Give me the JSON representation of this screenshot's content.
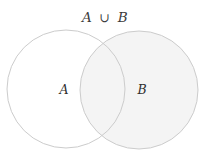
{
  "figure": {
    "kind": "venn-diagram",
    "background_color": "#ffffff",
    "width": 211,
    "height": 155
  },
  "title": {
    "full_text": "A ∪ B",
    "left_operand": "A",
    "operator": "∪",
    "right_operand": "B",
    "operator_name": "union",
    "x": 105,
    "y": 22,
    "color": "#3b3b3b"
  },
  "sets": [
    {
      "id": "set-a",
      "label": "A",
      "label_x": 64,
      "label_y": 94,
      "center_x": 66,
      "center_y": 89,
      "radius": 59,
      "fill_color": "#ffffff",
      "stroke_color": "#cccccc",
      "stroke_width": 1,
      "shaded": false
    },
    {
      "id": "set-b",
      "label": "B",
      "label_x": 142,
      "label_y": 94,
      "center_x": 139,
      "center_y": 90,
      "radius": 59,
      "fill_color": "#f4f4f4",
      "stroke_color": "#cccccc",
      "stroke_width": 1,
      "shaded": true
    }
  ],
  "regions": {
    "a_only": {
      "name": "A only",
      "fill_color": "#ffffff",
      "shaded": false
    },
    "intersection": {
      "name": "A intersect B",
      "fill_color": "#f4f4f4",
      "shaded": true
    },
    "b_only": {
      "name": "B only",
      "fill_color": "#f4f4f4",
      "shaded": true
    }
  },
  "colors": {
    "stroke": "#cccccc",
    "shade": "#f4f4f4",
    "text": "#3b3b3b",
    "background": "#ffffff"
  }
}
